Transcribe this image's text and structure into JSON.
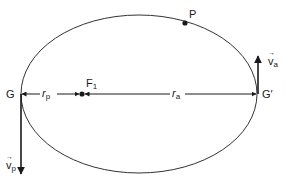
{
  "diagram": {
    "type": "orbital-ellipse",
    "colors": {
      "stroke": "#1a1a1a",
      "background": "#ffffff"
    },
    "labels": {
      "perigee": "G",
      "apogee": "G′",
      "focus": "F",
      "focus_sub": "1",
      "point": "P",
      "r_perigee": "r",
      "r_perigee_sub": "p",
      "r_apogee": "r",
      "r_apogee_sub": "a",
      "v_perigee": "v",
      "v_perigee_sub": "p",
      "v_apogee": "v",
      "v_apogee_sub": "a"
    }
  }
}
